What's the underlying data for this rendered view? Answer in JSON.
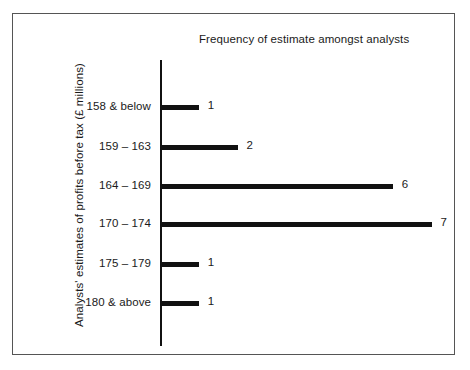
{
  "figure": {
    "frame_color": "#555555",
    "background": "#ffffff",
    "ink_color": "#111111"
  },
  "chart_data": {
    "type": "bar",
    "orientation": "horizontal",
    "title": "Frequency of estimate amongst analysts",
    "xlabel": "Frequency of estimate amongst analysts",
    "ylabel": "Analysts' estimates of profits before tax (£ millions)",
    "categories": [
      "158 & below",
      "159 – 163",
      "164 – 169",
      "170 – 174",
      "175 – 179",
      "180 & above"
    ],
    "values": [
      1,
      2,
      6,
      7,
      1,
      1
    ],
    "value_labels": [
      "1",
      "2",
      "6",
      "7",
      "1",
      "1"
    ],
    "xlim": [
      0,
      7
    ],
    "grid": false,
    "legend": false,
    "bar_color": "#111111",
    "px_per_unit": 38.8,
    "rows": [
      {
        "category": "158 & below",
        "value": 1,
        "label": "1",
        "y": 97
      },
      {
        "category": "159 – 163",
        "value": 2,
        "label": "2",
        "y": 137
      },
      {
        "category": "164 – 169",
        "value": 6,
        "label": "6",
        "y": 176
      },
      {
        "category": "170 – 174",
        "value": 7,
        "label": "7",
        "y": 214
      },
      {
        "category": "175 – 179",
        "value": 1,
        "label": "1",
        "y": 254
      },
      {
        "category": "180 & above",
        "value": 1,
        "label": "1",
        "y": 293
      }
    ]
  }
}
